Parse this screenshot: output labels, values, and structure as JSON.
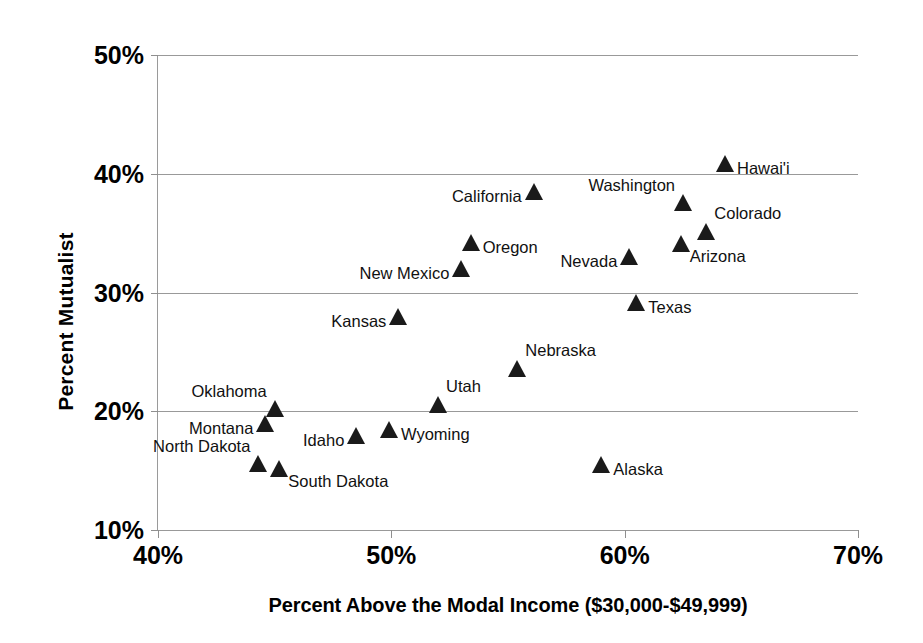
{
  "chart_data": {
    "type": "scatter",
    "title": "",
    "xlabel": "Percent Above the Modal Income ($30,000-$49,999)",
    "ylabel": "Percent Mutualist",
    "xlim": [
      40,
      70
    ],
    "ylim": [
      10,
      50
    ],
    "xticks": [
      "40%",
      "50%",
      "60%",
      "70%"
    ],
    "xtick_values": [
      40,
      50,
      60,
      70
    ],
    "yticks": [
      "50%",
      "40%",
      "30%",
      "20%",
      "10%"
    ],
    "ytick_values": [
      50,
      40,
      30,
      20,
      10
    ],
    "grid": "horizontal",
    "legend": "none",
    "marker": "triangle",
    "marker_color": "#1a1a1a",
    "points": [
      {
        "name": "Hawai'i",
        "x": 64.3,
        "y": 40.8,
        "label_pos": "right"
      },
      {
        "name": "California",
        "x": 56.1,
        "y": 38.5,
        "label_pos": "left"
      },
      {
        "name": "Washington",
        "x": 62.5,
        "y": 37.5,
        "label_pos": "upleft"
      },
      {
        "name": "Colorado",
        "x": 63.5,
        "y": 35.1,
        "label_pos": "upright"
      },
      {
        "name": "Oregon",
        "x": 53.4,
        "y": 34.2,
        "label_pos": "right"
      },
      {
        "name": "Arizona",
        "x": 62.4,
        "y": 34.1,
        "label_pos": "downright"
      },
      {
        "name": "Nevada",
        "x": 60.2,
        "y": 33.0,
        "label_pos": "left"
      },
      {
        "name": "New Mexico",
        "x": 53.0,
        "y": 32.0,
        "label_pos": "left"
      },
      {
        "name": "Texas",
        "x": 60.5,
        "y": 29.1,
        "label_pos": "right"
      },
      {
        "name": "Kansas",
        "x": 50.3,
        "y": 27.9,
        "label_pos": "left"
      },
      {
        "name": "Nebraska",
        "x": 55.4,
        "y": 23.6,
        "label_pos": "upright"
      },
      {
        "name": "Utah",
        "x": 52.0,
        "y": 20.5,
        "label_pos": "upright"
      },
      {
        "name": "Oklahoma",
        "x": 45.0,
        "y": 20.2,
        "label_pos": "upleft"
      },
      {
        "name": "Montana",
        "x": 44.6,
        "y": 18.9,
        "label_pos": "left"
      },
      {
        "name": "Wyoming",
        "x": 49.9,
        "y": 18.4,
        "label_pos": "right"
      },
      {
        "name": "Idaho",
        "x": 48.5,
        "y": 17.9,
        "label_pos": "left"
      },
      {
        "name": "Alaska",
        "x": 59.0,
        "y": 15.5,
        "label_pos": "right"
      },
      {
        "name": "North Dakota",
        "x": 44.3,
        "y": 15.6,
        "label_pos": "upleft"
      },
      {
        "name": "South Dakota",
        "x": 45.2,
        "y": 15.1,
        "label_pos": "downright"
      }
    ]
  }
}
